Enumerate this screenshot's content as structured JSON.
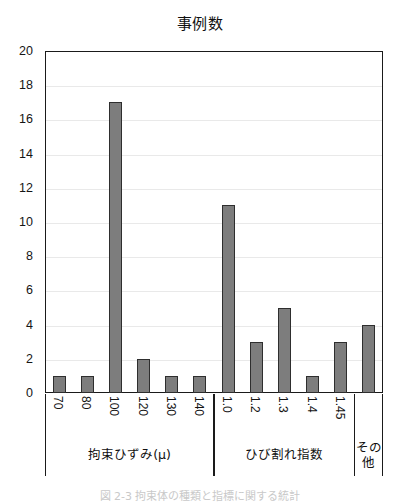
{
  "chart_data": {
    "type": "bar",
    "title": "事例数",
    "xlabel": "",
    "ylabel": "",
    "ylim": [
      0,
      20
    ],
    "ystep": 2,
    "grid": true,
    "legend": "none",
    "categories": [
      "70",
      "80",
      "100",
      "120",
      "130",
      "140",
      "1.0",
      "1.2",
      "1.3",
      "1.4",
      "1.45",
      ""
    ],
    "values": [
      1,
      1,
      17,
      2,
      1,
      1,
      11,
      3,
      5,
      1,
      3,
      4
    ],
    "ytick_labels": [
      "0",
      "2",
      "4",
      "6",
      "8",
      "10",
      "12",
      "14",
      "16",
      "18",
      "20"
    ],
    "ytick_values": [
      0,
      2,
      4,
      6,
      8,
      10,
      12,
      14,
      16,
      18,
      20
    ],
    "groups": [
      {
        "label": "拘束ひずみ(μ)",
        "categories": [
          "70",
          "80",
          "100",
          "120",
          "130",
          "140"
        ],
        "values": [
          1,
          1,
          17,
          2,
          1,
          1
        ]
      },
      {
        "label": "ひび割れ指数",
        "categories": [
          "1.0",
          "1.2",
          "1.3",
          "1.4",
          "1.45"
        ],
        "values": [
          11,
          3,
          5,
          1,
          3
        ]
      },
      {
        "label": "その他",
        "categories": [
          ""
        ],
        "values": [
          4
        ]
      }
    ],
    "bar_color": "#7d7d7d",
    "bar_edge_color": "#2e2e2e",
    "axis_color": "#1a1a1a",
    "grid_color": "#e9e9e9"
  },
  "caption": {
    "text": "図 2-3 拘束体の種類と指標に関する統計"
  }
}
